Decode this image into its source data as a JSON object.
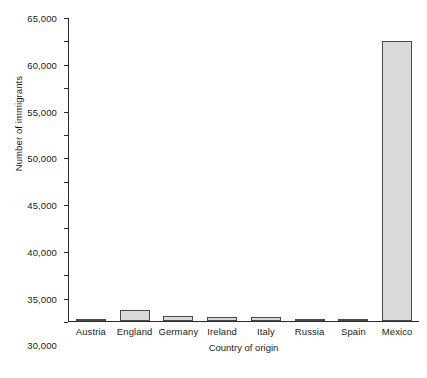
{
  "chart_data": {
    "type": "bar",
    "title": "",
    "xlabel": "Country of origin",
    "ylabel": "Number of immigrants",
    "categories": [
      "Austria",
      "England",
      "Germany",
      "Ireland",
      "Italy",
      "Russia",
      "Spain",
      "Mexico"
    ],
    "values": [
      300,
      2400,
      1000,
      800,
      800,
      500,
      450,
      60000
    ],
    "ylim": [
      0,
      65000
    ],
    "ytick_values": [
      0,
      5000,
      10000,
      15000,
      20000,
      25000,
      30000,
      35000,
      40000,
      45000,
      50000,
      55000,
      60000,
      65000
    ],
    "ytick_labels": [
      "0",
      "5,000",
      "10,000",
      "15,000",
      "20,000",
      "25,000",
      "30,000",
      "35,000",
      "40,000",
      "45,000",
      "50,000",
      "55,000",
      "60,000",
      "65,000"
    ],
    "grid": false,
    "legend": null,
    "bar_fill_color": "#d9d9d9",
    "bar_edge_color": "#4a4a4a",
    "axis_color": "#2b2b2b"
  }
}
